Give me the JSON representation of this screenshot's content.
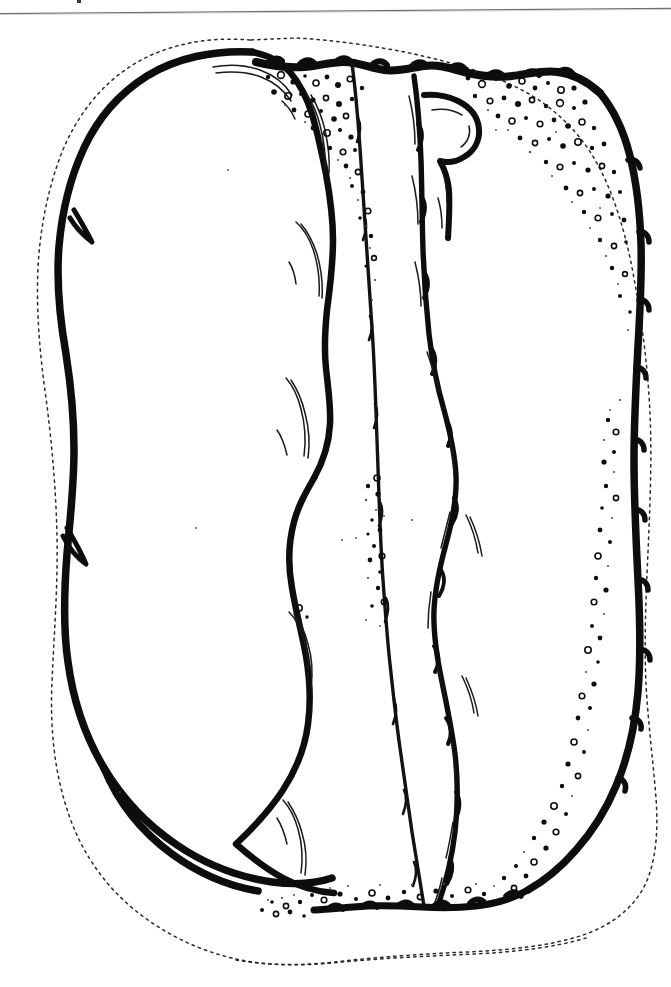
{
  "page": {
    "background_color": "#ffffff",
    "width": 671,
    "height": 987
  },
  "header_rule": {
    "name": "top-horizontal-rule",
    "color": "#6e6e6e",
    "y_left": 9,
    "y_right": 5,
    "thickness": 1.2
  },
  "artifact_marks": {
    "speck_color": "#3a3a3a"
  },
  "figure": {
    "caption": "",
    "ink_color": "#0d0d0d",
    "dotted_outline_color": "#2b2b2b",
    "vesicle_color": "#0d0d0d",
    "regions": [
      {
        "name": "left-lobe",
        "label": ""
      },
      {
        "name": "middle-band-a",
        "label": ""
      },
      {
        "name": "middle-band-b",
        "label": ""
      },
      {
        "name": "right-panel",
        "label": ""
      }
    ]
  }
}
